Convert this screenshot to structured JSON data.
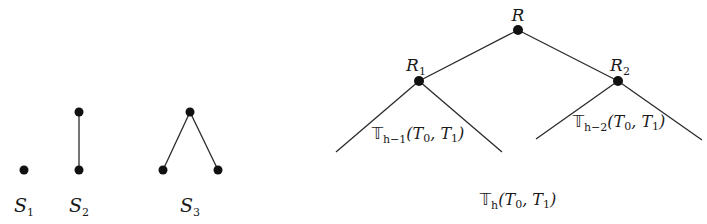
{
  "figure": {
    "small_structures": [
      {
        "id": "S1",
        "label_main": "S",
        "label_sub": "1",
        "label_pos": [
          24,
          212
        ],
        "nodes": [
          [
            24,
            170
          ]
        ],
        "edges": []
      },
      {
        "id": "S2",
        "label_main": "S",
        "label_sub": "2",
        "label_pos": [
          79,
          212
        ],
        "nodes": [
          [
            79,
            112
          ],
          [
            79,
            170
          ]
        ],
        "edges": [
          [
            0,
            1
          ]
        ]
      },
      {
        "id": "S3",
        "label_main": "S",
        "label_sub": "3",
        "label_pos": [
          190,
          212
        ],
        "nodes": [
          [
            190,
            112
          ],
          [
            163,
            170
          ],
          [
            218,
            170
          ]
        ],
        "edges": [
          [
            0,
            1
          ],
          [
            0,
            2
          ]
        ]
      }
    ],
    "tree": {
      "root": {
        "label_main": "R",
        "label_sub": "",
        "pos": [
          518,
          30
        ],
        "label_pos": [
          518,
          21
        ]
      },
      "left_child": {
        "label_main": "R",
        "label_sub": "1",
        "pos": [
          419,
          81
        ],
        "label_pos": [
          416,
          71
        ]
      },
      "right_child": {
        "label_main": "R",
        "label_sub": "2",
        "pos": [
          618,
          81
        ],
        "label_pos": [
          620,
          71
        ]
      },
      "left_subtree": {
        "apex": [
          419,
          81
        ],
        "left_end": [
          336,
          152
        ],
        "right_end": [
          502,
          152
        ],
        "label_bb": "𝕋",
        "label_sub": "h−1",
        "label_args": "(T",
        "label_args_sub0": "0",
        "label_args_mid": ", T",
        "label_args_sub1": "1",
        "label_args_end": ")",
        "label_pos": [
          418,
          139
        ]
      },
      "right_subtree": {
        "apex": [
          618,
          81
        ],
        "left_end": [
          536,
          139
        ],
        "right_end": [
          702,
          140
        ],
        "label_bb": "𝕋",
        "label_sub": "h−2",
        "label_args": "(T",
        "label_args_sub0": "0",
        "label_args_mid": ", T",
        "label_args_sub1": "1",
        "label_args_end": ")",
        "label_pos": [
          619,
          127
        ]
      },
      "caption": {
        "label_bb": "𝕋",
        "label_sub": "h",
        "label_args": "(T",
        "label_args_sub0": "0",
        "label_args_mid": ", T",
        "label_args_sub1": "1",
        "label_args_end": ")",
        "label_pos": [
          518,
          205
        ]
      }
    }
  }
}
